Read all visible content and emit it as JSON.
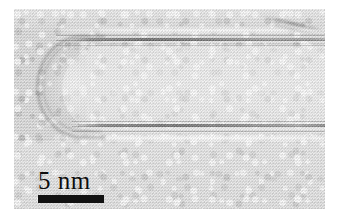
{
  "figure": {
    "kind": "tem-micrograph",
    "frame": {
      "x": 14,
      "y": 9,
      "width": 311,
      "height": 200
    },
    "background_color": "#ffffff",
    "film_color": "#d8d8d8"
  },
  "scalebar": {
    "label": "5 nm",
    "value": "5",
    "unit": "nm",
    "bar_length_px": "66",
    "color": "#121212"
  },
  "features": {
    "tube_wall_top": "graphitic lattice fringes",
    "tube_wall_bottom": "graphitic lattice fringes",
    "tube_cap": "hemispherical closed end",
    "tube_interior": "hollow core",
    "support": "amorphous carbon film",
    "streak": "diagonal contrast streak"
  }
}
